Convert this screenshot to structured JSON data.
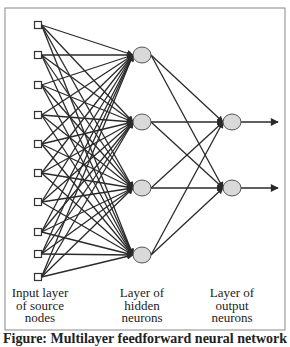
{
  "figure": {
    "caption": "Figure: Multilayer feedforward neural network",
    "frame": {
      "x": 5,
      "y": 8,
      "width": 280,
      "height": 322,
      "stroke": "#888888"
    },
    "colors": {
      "edge": "#2a2a2a",
      "neuron_fill": "#d9d9d9",
      "neuron_stroke": "#555555",
      "input_stroke": "#333333"
    }
  },
  "layers": {
    "input": {
      "label_lines": [
        "Input layer",
        "of source",
        "nodes"
      ],
      "label_center_x": 40,
      "label_top": 287,
      "x": 38,
      "node_size": 7,
      "nodes_y": [
        25,
        55,
        85,
        115,
        144,
        173,
        202,
        232,
        254,
        277
      ]
    },
    "hidden": {
      "label_lines": [
        "Layer of",
        "hidden",
        "neurons"
      ],
      "label_center_x": 142,
      "label_top": 287,
      "x": 142,
      "rx": 9,
      "ry": 8,
      "nodes_y": [
        55,
        122,
        188,
        255
      ]
    },
    "output": {
      "label_lines": [
        "Layer of",
        "output",
        "neurons"
      ],
      "label_center_x": 232,
      "label_top": 287,
      "x": 232,
      "rx": 9,
      "ry": 8,
      "nodes_y": [
        122,
        188
      ],
      "arrow_end_x": 278
    }
  }
}
